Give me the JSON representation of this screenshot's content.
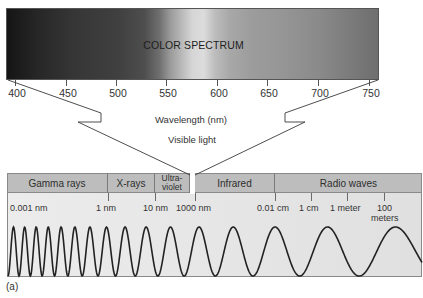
{
  "spectrum": {
    "title": "COLOR SPECTRUM",
    "ticks": [
      {
        "label": "400",
        "x": 15
      },
      {
        "label": "450",
        "x": 66
      },
      {
        "label": "500",
        "x": 116
      },
      {
        "label": "550",
        "x": 166
      },
      {
        "label": "600",
        "x": 217
      },
      {
        "label": "650",
        "x": 267
      },
      {
        "label": "700",
        "x": 318
      },
      {
        "label": "750",
        "x": 369
      }
    ],
    "axis_label": "Wavelength (nm)",
    "visible_label": "Visible light"
  },
  "em_spectrum": {
    "bands": [
      {
        "label": "Gamma rays",
        "left": 7,
        "width": 101
      },
      {
        "label": "X-rays",
        "left": 108,
        "width": 47
      },
      {
        "label": "Ultra-violet",
        "line1": "Ultra-",
        "line2": "violet",
        "left": 155,
        "width": 35
      },
      {
        "label": "Infrared",
        "left": 195,
        "width": 80
      },
      {
        "label": "Radio waves",
        "left": 275,
        "width": 147
      }
    ],
    "scale": [
      {
        "label": "0.001 nm",
        "x": 10,
        "tick": null
      },
      {
        "label": "1 nm",
        "x": 96,
        "tick": 108
      },
      {
        "label": "10 nm",
        "x": 143,
        "tick": 155
      },
      {
        "label": "1000 nm",
        "x": 176,
        "tick": 195
      },
      {
        "label": "0.01 cm",
        "x": 257,
        "tick": 275
      },
      {
        "label": "1 cm",
        "x": 299,
        "tick": 311
      },
      {
        "label": "1 meter",
        "x": 330,
        "tick": 347
      },
      {
        "label": "100",
        "x": 377,
        "tick": 384
      }
    ],
    "meters_label": "meters"
  },
  "figure_label": "(a)",
  "colors": {
    "line": "#2a2a2a",
    "band_fill": "#bdbdbd",
    "box_fill": "#e6e6e6"
  }
}
